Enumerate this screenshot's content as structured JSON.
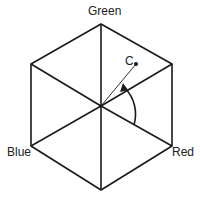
{
  "diagram": {
    "type": "HSV hexcone (color hexagon) diagram",
    "labels": {
      "green": "Green",
      "red": "Red",
      "blue": "Blue",
      "point": "C"
    },
    "colors": {
      "stroke": "#1a1a1a",
      "background": "#ffffff"
    }
  }
}
